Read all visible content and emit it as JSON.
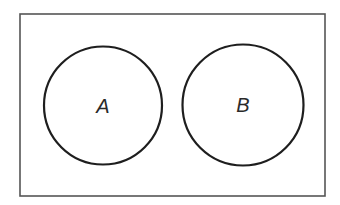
{
  "diagram": {
    "type": "venn",
    "universe": {
      "x": 20,
      "y": 14,
      "width": 305,
      "height": 182,
      "stroke": "#555555",
      "stroke_width": 1.6
    },
    "sets": [
      {
        "label": "A",
        "cx": 103,
        "cy": 105.5,
        "r": 59,
        "stroke": "#1e1e1e",
        "stroke_width": 2.2
      },
      {
        "label": "B",
        "cx": 243,
        "cy": 105,
        "r": 60.5,
        "stroke": "#1e1e1e",
        "stroke_width": 2.2
      }
    ],
    "relationship": "disjoint"
  }
}
